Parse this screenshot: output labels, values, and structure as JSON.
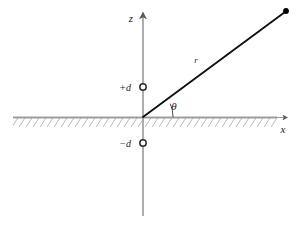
{
  "figure": {
    "colors": {
      "axis": "#8c8c8c",
      "ground": "#4a4a4a",
      "hatch": "#7a7a7a",
      "ray": "#111111",
      "marker_stroke": "#2b2b2b",
      "marker_fill": "#ffffff",
      "endpoint_fill": "#000000",
      "text": "#1a1a1a",
      "background": "#ffffff"
    },
    "labels": {
      "z_axis": "z",
      "x_axis": "x",
      "ray": "r",
      "angle": "θ",
      "source_positive": "+d",
      "source_negative": "−d"
    },
    "geometry": {
      "origin_x": 143,
      "origin_y": 117,
      "z_axis_top_y": 12,
      "z_axis_bottom_y": 216,
      "x_axis_left_x": 13,
      "x_axis_right_x": 289,
      "ray_end_x": 286,
      "ray_end_y": 11,
      "angle_degrees": 25,
      "source_positive_y": 87,
      "source_negative_y": 143,
      "marker_radius": 3.2,
      "arc_radius": 30
    }
  }
}
